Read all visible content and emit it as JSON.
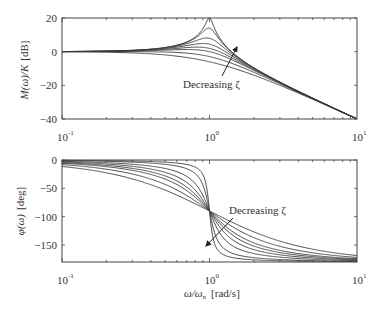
{
  "chart_data": [
    {
      "type": "line",
      "title": "",
      "xlabel": "",
      "ylabel": "M(ω)/K [dB]",
      "xscale": "log",
      "xlim": [
        0.1,
        10
      ],
      "ylim": [
        -40,
        20
      ],
      "xticks": [
        {
          "value": 0.1,
          "base": "10",
          "exp": "-1"
        },
        {
          "value": 1,
          "base": "10",
          "exp": "0"
        },
        {
          "value": 10,
          "base": "10",
          "exp": "1"
        }
      ],
      "yticks": [
        {
          "value": 20,
          "label": "20"
        },
        {
          "value": 0,
          "label": "0"
        },
        {
          "value": -20,
          "label": "−20"
        },
        {
          "value": -40,
          "label": "−40"
        }
      ],
      "grid": false,
      "legend": null,
      "zeta_values": [
        0.05,
        0.1,
        0.2,
        0.3,
        0.4,
        0.5,
        0.7,
        1.0
      ],
      "series_formula": "M = -20*log10(sqrt((1-u^2)^2 + (2*zeta*u)^2)), u = ω/ωn",
      "sample_x": [
        0.1,
        0.5,
        0.8,
        1.0,
        1.5,
        2,
        5,
        10
      ],
      "series": [
        {
          "name": "ζ=0.05",
          "values": [
            0.09,
            2.48,
            8.69,
            20.0,
            -1.96,
            -9.54,
            -27.6,
            -39.9
          ]
        },
        {
          "name": "ζ=0.1",
          "values": [
            0.09,
            2.44,
            8.08,
            13.98,
            -2.02,
            -9.57,
            -27.6,
            -39.9
          ]
        },
        {
          "name": "ζ=0.2",
          "values": [
            0.08,
            2.28,
            6.36,
            7.96,
            -2.34,
            -9.73,
            -27.6,
            -39.9
          ]
        },
        {
          "name": "ζ=0.3",
          "values": [
            0.07,
            2.02,
            4.53,
            4.44,
            -2.84,
            -9.96,
            -27.7,
            -39.9
          ]
        },
        {
          "name": "ζ=0.4",
          "values": [
            0.05,
            1.66,
            2.87,
            1.94,
            -3.47,
            -10.3,
            -27.7,
            -39.9
          ]
        },
        {
          "name": "ζ=0.5",
          "values": [
            0.04,
            1.25,
            1.47,
            0.0,
            -4.21,
            -10.6,
            -27.8,
            -39.9
          ]
        },
        {
          "name": "ζ=0.7",
          "values": [
            0.0,
            0.22,
            -0.73,
            -2.92,
            -5.83,
            -11.6,
            -28.0,
            -40.0
          ]
        },
        {
          "name": "ζ=1.0",
          "values": [
            -0.09,
            -1.94,
            -4.3,
            -6.02,
            -8.3,
            -13.98,
            -28.3,
            -40.1
          ]
        }
      ],
      "annotations": [
        {
          "text": "Decreasing ζ",
          "arrow_direction": "up-right"
        }
      ]
    },
    {
      "type": "line",
      "title": "",
      "xlabel": "ω/ωn [rad/s]",
      "ylabel": "φ(ω) [deg]",
      "xscale": "log",
      "xlim": [
        0.1,
        10
      ],
      "ylim": [
        -180,
        0
      ],
      "xticks": [
        {
          "value": 0.1,
          "base": "10",
          "exp": "-1"
        },
        {
          "value": 1,
          "base": "10",
          "exp": "0"
        },
        {
          "value": 10,
          "base": "10",
          "exp": "1"
        }
      ],
      "yticks": [
        {
          "value": 0,
          "label": "0"
        },
        {
          "value": -50,
          "label": "−50"
        },
        {
          "value": -100,
          "label": "−100"
        },
        {
          "value": -150,
          "label": "−150"
        }
      ],
      "grid": false,
      "legend": null,
      "zeta_values": [
        0.05,
        0.1,
        0.2,
        0.3,
        0.4,
        0.5,
        0.7,
        1.0
      ],
      "series_formula": "φ = -atan2(2*zeta*u, 1-u^2) in degrees",
      "sample_x": [
        0.1,
        0.5,
        0.8,
        1.0,
        1.5,
        2,
        5,
        10
      ],
      "series": [
        {
          "name": "ζ=0.05",
          "values": [
            -0.58,
            -3.81,
            -12.5,
            -90,
            -173.2,
            -176.2,
            -179.4,
            -179.4
          ]
        },
        {
          "name": "ζ=0.1",
          "values": [
            -1.16,
            -7.6,
            -24.0,
            -90,
            -166.5,
            -172.4,
            -178.8,
            -178.8
          ]
        },
        {
          "name": "ζ=0.2",
          "values": [
            -2.31,
            -14.9,
            -41.6,
            -90,
            -154.4,
            -165.1,
            -177.6,
            -177.7
          ]
        },
        {
          "name": "ζ=0.3",
          "values": [
            -3.47,
            -21.8,
            -53.1,
            -90,
            -144.2,
            -158.2,
            -176.4,
            -176.5
          ]
        },
        {
          "name": "ζ=0.4",
          "values": [
            -4.62,
            -28.1,
            -60.6,
            -90,
            -136.2,
            -151.9,
            -175.2,
            -175.4
          ]
        },
        {
          "name": "ζ=0.5",
          "values": [
            -5.77,
            -33.7,
            -65.8,
            -90,
            -129.8,
            -146.3,
            -173.8,
            -174.2
          ]
        },
        {
          "name": "ζ=0.7",
          "values": [
            -8.05,
            -43.0,
            -72.0,
            -90,
            -120.3,
            -137.0,
            -171.7,
            -171.9
          ]
        },
        {
          "name": "ζ=1.0",
          "values": [
            -11.4,
            -53.1,
            -77.3,
            -90,
            -112.6,
            -126.9,
            -157.4,
            -168.6
          ]
        }
      ],
      "annotations": [
        {
          "text": "Decreasing ζ",
          "arrow_direction": "down-left"
        }
      ]
    }
  ],
  "labels": {
    "top_ylabel_main": "M(ω)/K",
    "top_ylabel_unit": "[dB]",
    "bottom_ylabel_main": "φ(ω)",
    "bottom_ylabel_unit": "[deg]",
    "xlabel_main": "ω/ω",
    "xlabel_sub": "n",
    "xlabel_unit": "[rad/s]",
    "top_annotation": "Decreasing ζ",
    "bottom_annotation": "Decreasing ζ"
  },
  "style": {
    "line_color": "#3a3a3a",
    "axis_color": "#444444",
    "background": "#ffffff"
  }
}
